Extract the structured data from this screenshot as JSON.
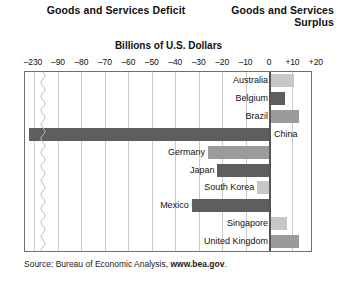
{
  "headers": {
    "deficit": "Goods and Services Deficit",
    "surplus_line1": "Goods and Services",
    "surplus_line2": "Surplus",
    "units": "Billions of U.S. Dollars"
  },
  "source": {
    "prefix": "Source: Bureau of Economic Analysis, ",
    "site": "www.bea.gov",
    "suffix": "."
  },
  "chart_data": {
    "type": "bar",
    "orientation": "horizontal",
    "xlabel": "Billions of U.S. Dollars",
    "ylabel": "",
    "xlim": [
      -230,
      20
    ],
    "axis_break": true,
    "axis_break_between": [
      -230,
      -90
    ],
    "grid": true,
    "legend": "none",
    "tick_labels": [
      "–230",
      "–90",
      "–80",
      "–70",
      "–60",
      "–50",
      "–40",
      "–30",
      "–20",
      "–10",
      "0",
      "+10",
      "+20"
    ],
    "tick_values": [
      -230,
      -90,
      -80,
      -70,
      -60,
      -50,
      -40,
      -30,
      -20,
      -10,
      0,
      10,
      20
    ],
    "categories": [
      "Australia",
      "Belgium",
      "Brazil",
      "China",
      "Germany",
      "Japan",
      "South Korea",
      "Mexico",
      "Singapore",
      "United Kingdom"
    ],
    "values": [
      10,
      6,
      12,
      -230,
      -26,
      -22,
      -5,
      -33,
      7,
      12
    ],
    "bars": [
      {
        "label": "Australia",
        "value": 10,
        "shade": "light",
        "label_side": "left"
      },
      {
        "label": "Belgium",
        "value": 6,
        "shade": "dark",
        "label_side": "left"
      },
      {
        "label": "Brazil",
        "value": 12,
        "shade": "mid",
        "label_side": "left"
      },
      {
        "label": "China",
        "value": -230,
        "shade": "dark",
        "label_side": "right"
      },
      {
        "label": "Germany",
        "value": -26,
        "shade": "mid",
        "label_side": "left"
      },
      {
        "label": "Japan",
        "value": -22,
        "shade": "dark",
        "label_side": "left"
      },
      {
        "label": "South Korea",
        "value": -5,
        "shade": "light",
        "label_side": "left"
      },
      {
        "label": "Mexico",
        "value": -33,
        "shade": "dark",
        "label_side": "left"
      },
      {
        "label": "Singapore",
        "value": 7,
        "shade": "light",
        "label_side": "left"
      },
      {
        "label": "United Kingdom",
        "value": 12,
        "shade": "mid",
        "label_side": "left"
      }
    ],
    "colors": {
      "dark": "#5e5e5e",
      "mid": "#9b9b9b",
      "light": "#c7c7c7",
      "grid": "#c9c9c9",
      "frame": "#6f6f6f",
      "zero": "#555555"
    }
  }
}
